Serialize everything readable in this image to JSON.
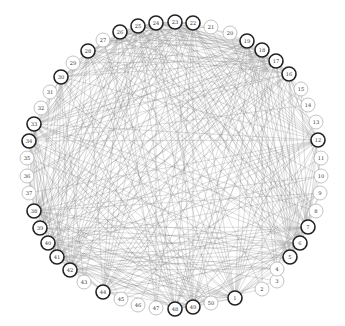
{
  "layout": {
    "cx": 172,
    "cy": 164,
    "r": 146,
    "node_radius": 7
  },
  "colors": {
    "edge": "#7a7a7a",
    "node_fill": "#ffffff",
    "node_stroke": "#9a9a9a",
    "hub_stroke": "#222222",
    "label": "#333333"
  },
  "nodes": [
    {
      "id": "1",
      "x": 235,
      "y": 298,
      "hub": true
    },
    {
      "id": "2",
      "x": 262,
      "y": 289,
      "hub": false
    },
    {
      "id": "3",
      "x": 277,
      "y": 281,
      "hub": false
    },
    {
      "id": "4",
      "x": 277,
      "y": 269,
      "hub": false
    },
    {
      "id": "5",
      "x": 290,
      "y": 257,
      "hub": true
    },
    {
      "id": "6",
      "x": 300,
      "y": 243,
      "hub": true
    },
    {
      "id": "7",
      "x": 308,
      "y": 227,
      "hub": true
    },
    {
      "id": "8",
      "x": 316,
      "y": 211,
      "hub": false
    },
    {
      "id": "9",
      "x": 320,
      "y": 193,
      "hub": false
    },
    {
      "id": "10",
      "x": 321,
      "y": 176,
      "hub": false
    },
    {
      "id": "11",
      "x": 321,
      "y": 158,
      "hub": false
    },
    {
      "id": "12",
      "x": 318,
      "y": 140,
      "hub": true
    },
    {
      "id": "13",
      "x": 316,
      "y": 122,
      "hub": false
    },
    {
      "id": "14",
      "x": 308,
      "y": 105,
      "hub": false
    },
    {
      "id": "15",
      "x": 301,
      "y": 89,
      "hub": false
    },
    {
      "id": "16",
      "x": 289,
      "y": 74,
      "hub": true
    },
    {
      "id": "17",
      "x": 276,
      "y": 61,
      "hub": true
    },
    {
      "id": "18",
      "x": 262,
      "y": 50,
      "hub": true
    },
    {
      "id": "19",
      "x": 247,
      "y": 41,
      "hub": true
    },
    {
      "id": "20",
      "x": 230,
      "y": 33,
      "hub": false
    },
    {
      "id": "21",
      "x": 211,
      "y": 27,
      "hub": false
    },
    {
      "id": "22",
      "x": 193,
      "y": 23,
      "hub": true
    },
    {
      "id": "23",
      "x": 175,
      "y": 22,
      "hub": true
    },
    {
      "id": "24",
      "x": 156,
      "y": 23,
      "hub": true
    },
    {
      "id": "25",
      "x": 138,
      "y": 26,
      "hub": true
    },
    {
      "id": "26",
      "x": 120,
      "y": 32,
      "hub": true
    },
    {
      "id": "27",
      "x": 103,
      "y": 40,
      "hub": false
    },
    {
      "id": "28",
      "x": 88,
      "y": 51,
      "hub": true
    },
    {
      "id": "29",
      "x": 73,
      "y": 63,
      "hub": false
    },
    {
      "id": "30",
      "x": 61,
      "y": 77,
      "hub": true
    },
    {
      "id": "31",
      "x": 50,
      "y": 92,
      "hub": false
    },
    {
      "id": "32",
      "x": 41,
      "y": 108,
      "hub": false
    },
    {
      "id": "33",
      "x": 34,
      "y": 124,
      "hub": true
    },
    {
      "id": "34",
      "x": 29,
      "y": 141,
      "hub": true
    },
    {
      "id": "35",
      "x": 27,
      "y": 158,
      "hub": false
    },
    {
      "id": "36",
      "x": 27,
      "y": 176,
      "hub": false
    },
    {
      "id": "37",
      "x": 29,
      "y": 193,
      "hub": false
    },
    {
      "id": "38",
      "x": 34,
      "y": 211,
      "hub": true
    },
    {
      "id": "39",
      "x": 40,
      "y": 228,
      "hub": true
    },
    {
      "id": "40",
      "x": 48,
      "y": 243,
      "hub": true
    },
    {
      "id": "41",
      "x": 57,
      "y": 257,
      "hub": true
    },
    {
      "id": "42",
      "x": 70,
      "y": 270,
      "hub": true
    },
    {
      "id": "43",
      "x": 84,
      "y": 282,
      "hub": false
    },
    {
      "id": "44",
      "x": 103,
      "y": 292,
      "hub": true
    },
    {
      "id": "45",
      "x": 121,
      "y": 299,
      "hub": false
    },
    {
      "id": "46",
      "x": 138,
      "y": 305,
      "hub": false
    },
    {
      "id": "47",
      "x": 156,
      "y": 308,
      "hub": false
    },
    {
      "id": "48",
      "x": 175,
      "y": 309,
      "hub": true
    },
    {
      "id": "49",
      "x": 193,
      "y": 307,
      "hub": true
    },
    {
      "id": "50",
      "x": 211,
      "y": 303,
      "hub": false
    }
  ]
}
